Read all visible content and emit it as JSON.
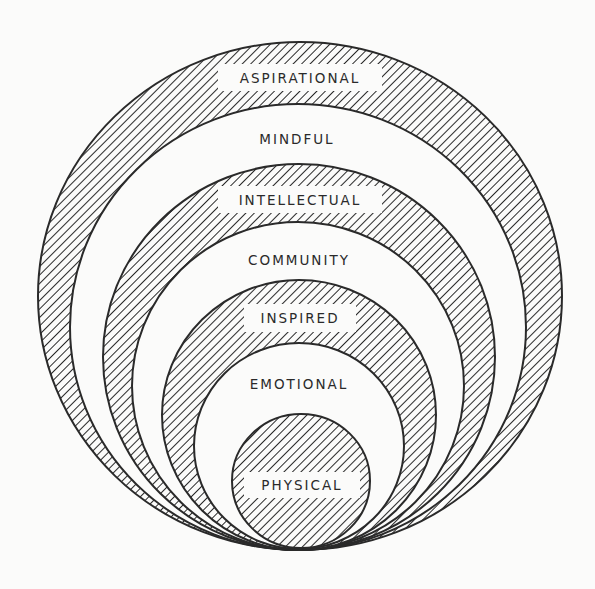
{
  "diagram": {
    "title": "",
    "colors": {
      "background": "#fbfbfa",
      "stroke": "#2a2a2a",
      "hatch": "#2a2a2a",
      "white_fill": "#fbfbfa",
      "text": "#2a2a2a"
    },
    "rings": [
      {
        "id": "aspirational",
        "label": "ASPIRATIONAL",
        "style": "hatched",
        "cx": 300,
        "cy": 296,
        "r": 256,
        "label_y": 77,
        "label_box": true,
        "box_w": 164
      },
      {
        "id": "mindful",
        "label": "MINDFUL",
        "style": "white",
        "cx": 300,
        "cy": 327,
        "r": 224,
        "label_y": 138,
        "label_box": false,
        "box_w": 0
      },
      {
        "id": "intellectual",
        "label": "INTELLECTUAL",
        "style": "hatched",
        "cx": 300,
        "cy": 357,
        "r": 194,
        "label_y": 200,
        "label_box": true,
        "box_w": 164
      },
      {
        "id": "community",
        "label": "COMMUNITY",
        "style": "white",
        "cx": 300,
        "cy": 386,
        "r": 165,
        "label_y": 260,
        "label_box": false,
        "box_w": 0
      },
      {
        "id": "inspired",
        "label": "INSPIRED",
        "style": "hatched",
        "cx": 300,
        "cy": 415,
        "r": 135,
        "label_y": 318,
        "label_box": true,
        "box_w": 112
      },
      {
        "id": "emotional",
        "label": "EMOTIONAL",
        "style": "white",
        "cx": 300,
        "cy": 446,
        "r": 104,
        "label_y": 383,
        "label_box": false,
        "box_w": 0
      },
      {
        "id": "physical",
        "label": "PHYSICAL",
        "style": "hatched",
        "cx": 301,
        "cy": 481,
        "r": 68,
        "label_y": 485,
        "label_box": true,
        "box_w": 118
      }
    ],
    "labels": {
      "aspirational": "ASPIRATIONAL",
      "mindful": "MINDFUL",
      "intellectual": "INTELLECTUAL",
      "community": "COMMUNITY",
      "inspired": "INSPIRED",
      "emotional": "EMOTIONAL",
      "physical": "PHYSICAL"
    }
  }
}
